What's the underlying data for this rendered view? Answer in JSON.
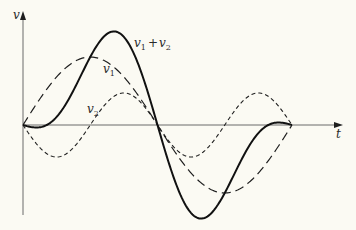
{
  "diagram": {
    "title": "",
    "axes": {
      "y_label": "v",
      "x_label": "t"
    },
    "curves": [
      {
        "name": "v1",
        "label": "v",
        "subscript": "1",
        "style": "long-dash",
        "description": "fundamental sine wave"
      },
      {
        "name": "v2",
        "label": "v",
        "subscript": "2",
        "style": "short-dash",
        "description": "second harmonic, inverted phase"
      },
      {
        "name": "sum",
        "label": "v",
        "subscript": "1",
        "plus": "+",
        "label2": "v",
        "subscript2": "2",
        "style": "solid",
        "description": "v1 + v2 resultant waveform"
      }
    ],
    "colors": {
      "background": "#fbfaf3",
      "ink": "#1e1e1e",
      "axis": "#555555"
    }
  },
  "chart_data": {
    "type": "line",
    "title": "",
    "xlabel": "t",
    "ylabel": "v",
    "x_range_periods": [
      0,
      1
    ],
    "series": [
      {
        "name": "v1",
        "amplitude": 68,
        "harmonic": 1,
        "phase": "sin"
      },
      {
        "name": "v2",
        "amplitude": 32,
        "harmonic": 2,
        "phase": "-sin"
      },
      {
        "name": "v1 + v2",
        "composed_of": [
          "v1",
          "v2"
        ]
      }
    ],
    "grid": false,
    "legend": "inline labels"
  }
}
